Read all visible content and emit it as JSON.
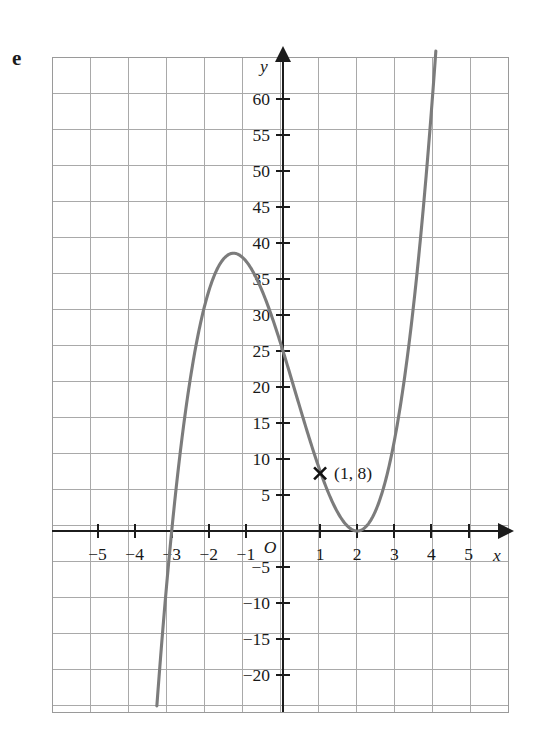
{
  "figure": {
    "part_label": "e",
    "axis_x_name": "x",
    "axis_y_name": "y",
    "origin_label": "O"
  },
  "annotation": {
    "marker_icon": "cross-marker-icon",
    "label": "(1, 8)",
    "x": 1,
    "y": 8
  },
  "chart_data": {
    "type": "line",
    "title": "",
    "subtitle": "",
    "xlabel": "x",
    "ylabel": "y",
    "grid": true,
    "legend": null,
    "xlim": [
      -6,
      6
    ],
    "ylim": [
      -22.5,
      65
    ],
    "x_ticks": [
      -5,
      -4,
      -3,
      -2,
      -1,
      1,
      2,
      3,
      4,
      5
    ],
    "x_tick_labels": [
      "−5",
      "−4",
      "−3",
      "−2",
      "−1",
      "1",
      "2",
      "3",
      "4",
      "5"
    ],
    "y_ticks": [
      60,
      55,
      50,
      45,
      40,
      35,
      30,
      25,
      20,
      15,
      10,
      5,
      -5,
      -10,
      -15,
      -20
    ],
    "y_tick_labels": [
      "60",
      "55",
      "50",
      "45",
      "40",
      "35",
      "30",
      "25",
      "20",
      "15",
      "10",
      "5",
      "−5",
      "−10",
      "−15",
      "−20"
    ],
    "curve_color": "#7c7c7c",
    "grid_color": "#a9a9a9",
    "axis_color": "#1c1c1c",
    "function": "y = 2.08(x + 3)(x - 2)^2",
    "roots": [
      -3,
      2
    ],
    "double_root": 2,
    "y_intercept": 25,
    "local_maximum": {
      "x": -1.33,
      "y": 37
    },
    "local_minimum": {
      "x": 2,
      "y": 0
    },
    "annotated_point": {
      "x": 1,
      "y": 8
    },
    "series": [
      {
        "name": "cubic",
        "points": [
          [
            -3.55,
            -23.0
          ],
          [
            -3.5,
            -20.4
          ],
          [
            -3.4,
            -15.5
          ],
          [
            -3.3,
            -10.9
          ],
          [
            -3.2,
            -6.6
          ],
          [
            -3.1,
            -2.6
          ],
          [
            -3.0,
            0.0
          ],
          [
            -2.9,
            4.4
          ],
          [
            -2.8,
            7.6
          ],
          [
            -2.6,
            13.6
          ],
          [
            -2.4,
            18.8
          ],
          [
            -2.2,
            23.3
          ],
          [
            -2.0,
            27.0
          ],
          [
            -1.8,
            30.1
          ],
          [
            -1.6,
            32.6
          ],
          [
            -1.4,
            34.5
          ],
          [
            -1.2,
            35.9
          ],
          [
            -1.0,
            36.8
          ],
          [
            -0.8,
            37.2
          ],
          [
            -0.6,
            37.2
          ],
          [
            -0.4,
            36.8
          ],
          [
            -0.2,
            36.1
          ],
          [
            0.0,
            25.0
          ],
          [
            0.2,
            31.8
          ],
          [
            0.4,
            29.3
          ],
          [
            0.6,
            26.6
          ],
          [
            0.8,
            23.7
          ],
          [
            1.0,
            16.6
          ],
          [
            1.2,
            13.2
          ],
          [
            1.4,
            9.9
          ],
          [
            1.6,
            6.7
          ],
          [
            1.8,
            3.5
          ],
          [
            2.0,
            0.0
          ],
          [
            2.2,
            0.9
          ],
          [
            2.4,
            1.6
          ],
          [
            2.6,
            4.0
          ],
          [
            2.8,
            7.3
          ],
          [
            3.0,
            12.5
          ],
          [
            3.2,
            17.5
          ],
          [
            3.4,
            23.3
          ],
          [
            3.6,
            30.1
          ],
          [
            3.8,
            37.9
          ],
          [
            4.0,
            46.8
          ],
          [
            4.2,
            56.7
          ],
          [
            4.35,
            64.5
          ]
        ]
      }
    ]
  }
}
